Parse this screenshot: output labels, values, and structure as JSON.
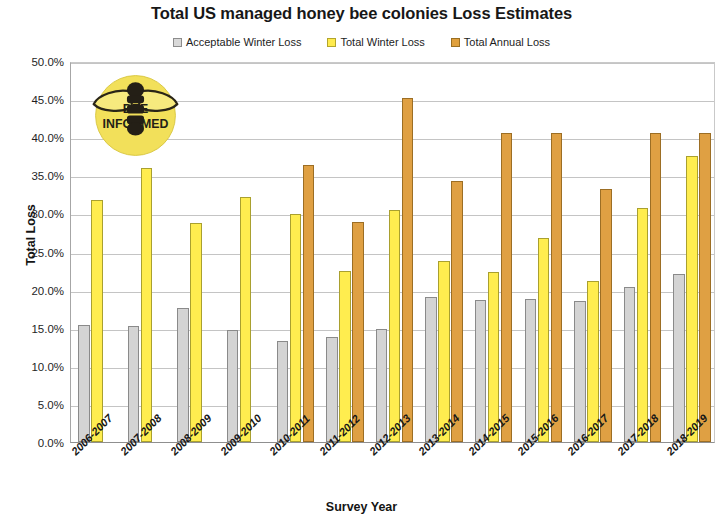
{
  "chart_data": {
    "type": "bar",
    "title": "Total US managed honey bee colonies Loss Estimates",
    "xlabel": "Survey Year",
    "ylabel": "Total Loss",
    "ylim": [
      0,
      50
    ],
    "ytick_labels": [
      "0.0%",
      "5.0%",
      "10.0%",
      "15.0%",
      "20.0%",
      "25.0%",
      "30.0%",
      "35.0%",
      "40.0%",
      "45.0%",
      "50.0%"
    ],
    "ytick_values": [
      0,
      5,
      10,
      15,
      20,
      25,
      30,
      35,
      40,
      45,
      50
    ],
    "grid": true,
    "legend_position": "top-center",
    "categories": [
      "2006-2007",
      "2007-2008",
      "2008-2009",
      "2009-2010",
      "2010-2011",
      "2011-2012",
      "2012-2013",
      "2013-2014",
      "2014-2015",
      "2015-2016",
      "2016-2017",
      "2017-2018",
      "2018-2019"
    ],
    "series": [
      {
        "name": "Acceptable Winter Loss",
        "color": "#d4d4d4",
        "values": [
          15.3,
          15.2,
          17.6,
          14.7,
          13.2,
          13.8,
          14.8,
          19.0,
          18.6,
          18.8,
          18.5,
          20.4,
          22.0
        ]
      },
      {
        "name": "Total Winter Loss",
        "color": "#ffed4f",
        "values": [
          31.8,
          35.9,
          28.7,
          32.2,
          29.9,
          22.4,
          30.5,
          23.7,
          22.3,
          26.8,
          21.1,
          30.7,
          37.5
        ]
      },
      {
        "name": "Total Annual Loss",
        "color": "#dfa043",
        "values": [
          null,
          null,
          null,
          null,
          36.4,
          28.9,
          45.2,
          34.2,
          40.5,
          40.5,
          33.2,
          40.6,
          40.5
        ]
      }
    ]
  },
  "legend": {
    "items": [
      {
        "label": "Acceptable Winter Loss",
        "swatch": "sw-gray"
      },
      {
        "label": "Total Winter Loss",
        "swatch": "sw-yellow"
      },
      {
        "label": "Total Annual Loss",
        "swatch": "sw-orange"
      }
    ]
  },
  "logo": {
    "line1": "BEE",
    "line2": "INFORMED",
    "body_color": "#241f16",
    "circle_color": "#f2e05a"
  }
}
